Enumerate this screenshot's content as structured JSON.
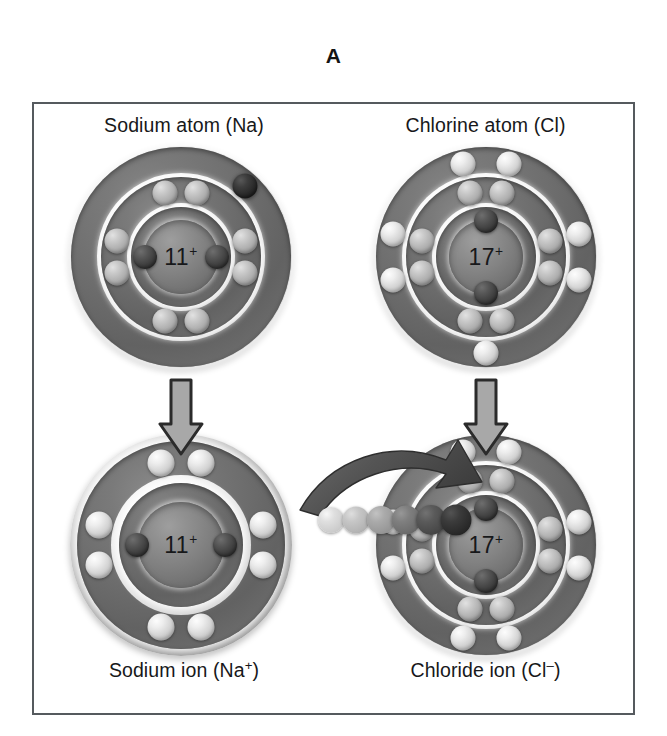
{
  "figure": {
    "letter": "A"
  },
  "panel": {
    "border_color": "#555a5e",
    "background": "#ffffff"
  },
  "captions": {
    "sodium_atom": "Sodium atom (Na)",
    "chlorine_atom": "Chlorine atom (Cl)",
    "sodium_ion_text": "Sodium ion (Na",
    "sodium_ion_charge": "+",
    "sodium_ion_close": ")",
    "chloride_ion_text": "Chloride ion (Cl",
    "chloride_ion_charge": "–",
    "chloride_ion_close": ")"
  },
  "atoms": {
    "sodium_atom": {
      "name": "Sodium atom",
      "symbol": "Na",
      "nucleus_number": "11",
      "nucleus_charge": "+",
      "nucleus_label": "11+",
      "shell_electron_counts": [
        2,
        8,
        1
      ],
      "total_electrons": 11,
      "net_charge": "0",
      "valence_electron_highlighted": true
    },
    "chlorine_atom": {
      "name": "Chlorine atom",
      "symbol": "Cl",
      "nucleus_number": "17",
      "nucleus_charge": "+",
      "nucleus_label": "17+",
      "shell_electron_counts": [
        2,
        8,
        7
      ],
      "total_electrons": 17,
      "net_charge": "0",
      "valence_electron_highlighted": false
    },
    "sodium_ion": {
      "name": "Sodium ion",
      "symbol": "Na+",
      "nucleus_number": "11",
      "nucleus_charge": "+",
      "nucleus_label": "11+",
      "shell_electron_counts": [
        2,
        8
      ],
      "total_electrons": 10,
      "net_charge": "+1",
      "valence_electron_highlighted": false
    },
    "chloride_ion": {
      "name": "Chloride ion",
      "symbol": "Cl-",
      "nucleus_number": "17",
      "nucleus_charge": "+",
      "nucleus_label": "17+",
      "shell_electron_counts": [
        2,
        8,
        8
      ],
      "total_electrons": 18,
      "net_charge": "-1",
      "valence_electron_highlighted": true
    }
  },
  "process": {
    "down_arrow_left_label": "sodium becomes sodium ion",
    "down_arrow_right_label": "chlorine becomes chloride ion",
    "transfer_arrow_label": "electron transfer from sodium to chlorine",
    "trail_dot_count": 6,
    "trail_shades": [
      "#cfcfcf",
      "#b6b6b6",
      "#9a9a9a",
      "#6f6f6f",
      "#4a4a4a",
      "#2b2b2b"
    ]
  },
  "colors": {
    "outline": "#555a5e",
    "arrow_fill": "#a8a8a8",
    "arrow_stroke": "#2b2b2b",
    "curved_arrow_fill": "#5a5a5a",
    "electron_light": "#d4d4d4",
    "electron_mid": "#b0b0b0",
    "electron_dark": "#3f3f3f",
    "nucleus": "#818181",
    "text": "#17181a"
  }
}
